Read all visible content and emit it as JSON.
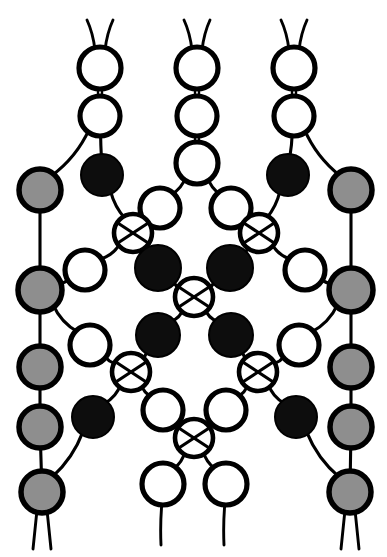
{
  "figure": {
    "width": 387,
    "height": 557,
    "background_color": "#ffffff",
    "stroke_color": "#000000",
    "node_types": {
      "white": {
        "fill": "#ffffff",
        "label": "open node"
      },
      "black": {
        "fill": "#0d0d0d",
        "label": "filled node"
      },
      "gray": {
        "fill": "#8e8e8e",
        "label": "shaded node"
      },
      "crossing": {
        "fill": "#ffffff",
        "label": "crossing node"
      }
    }
  },
  "chart_data": {
    "type": "diagram",
    "xlim": [
      0,
      387
    ],
    "ylim": [
      0,
      557
    ],
    "grid": false,
    "legend": null,
    "nodes": [
      {
        "id": "t1",
        "x": 100,
        "y": 68,
        "r": 21,
        "kind": "white"
      },
      {
        "id": "t2",
        "x": 197,
        "y": 68,
        "r": 21,
        "kind": "white"
      },
      {
        "id": "t3",
        "x": 294,
        "y": 68,
        "r": 21,
        "kind": "white"
      },
      {
        "id": "u1",
        "x": 100,
        "y": 116,
        "r": 20,
        "kind": "white"
      },
      {
        "id": "u2",
        "x": 197,
        "y": 116,
        "r": 20,
        "kind": "white"
      },
      {
        "id": "u3",
        "x": 294,
        "y": 116,
        "r": 20,
        "kind": "white"
      },
      {
        "id": "m2",
        "x": 197,
        "y": 163,
        "r": 21,
        "kind": "white"
      },
      {
        "id": "bL1",
        "x": 102,
        "y": 175,
        "r": 21,
        "kind": "black"
      },
      {
        "id": "bR1",
        "x": 288,
        "y": 175,
        "r": 21,
        "kind": "black"
      },
      {
        "id": "gL1",
        "x": 40,
        "y": 190,
        "r": 21,
        "kind": "gray"
      },
      {
        "id": "gR1",
        "x": 351,
        "y": 190,
        "r": 21,
        "kind": "gray"
      },
      {
        "id": "wL2",
        "x": 160,
        "y": 208,
        "r": 20,
        "kind": "white"
      },
      {
        "id": "wR2",
        "x": 231,
        "y": 208,
        "r": 20,
        "kind": "white"
      },
      {
        "id": "xL1",
        "x": 133,
        "y": 233,
        "r": 19,
        "kind": "crossing"
      },
      {
        "id": "xR1",
        "x": 259,
        "y": 233,
        "r": 19,
        "kind": "crossing"
      },
      {
        "id": "wL3",
        "x": 85,
        "y": 270,
        "r": 20,
        "kind": "white"
      },
      {
        "id": "wR3",
        "x": 305,
        "y": 270,
        "r": 20,
        "kind": "white"
      },
      {
        "id": "bL2",
        "x": 158,
        "y": 268,
        "r": 23,
        "kind": "black"
      },
      {
        "id": "bR2",
        "x": 230,
        "y": 268,
        "r": 23,
        "kind": "black"
      },
      {
        "id": "gL2",
        "x": 40,
        "y": 290,
        "r": 22,
        "kind": "gray"
      },
      {
        "id": "gR2",
        "x": 351,
        "y": 290,
        "r": 22,
        "kind": "gray"
      },
      {
        "id": "xC1",
        "x": 194,
        "y": 297,
        "r": 19,
        "kind": "crossing"
      },
      {
        "id": "bL3",
        "x": 158,
        "y": 335,
        "r": 22,
        "kind": "black"
      },
      {
        "id": "bR3",
        "x": 231,
        "y": 335,
        "r": 22,
        "kind": "black"
      },
      {
        "id": "wL4",
        "x": 90,
        "y": 345,
        "r": 20,
        "kind": "white"
      },
      {
        "id": "wR4",
        "x": 299,
        "y": 345,
        "r": 20,
        "kind": "white"
      },
      {
        "id": "gL3",
        "x": 40,
        "y": 367,
        "r": 21,
        "kind": "gray"
      },
      {
        "id": "gR3",
        "x": 351,
        "y": 367,
        "r": 21,
        "kind": "gray"
      },
      {
        "id": "xL2",
        "x": 131,
        "y": 372,
        "r": 19,
        "kind": "crossing"
      },
      {
        "id": "xR2",
        "x": 258,
        "y": 372,
        "r": 19,
        "kind": "crossing"
      },
      {
        "id": "wL5",
        "x": 163,
        "y": 410,
        "r": 20,
        "kind": "white"
      },
      {
        "id": "wR5",
        "x": 226,
        "y": 410,
        "r": 20,
        "kind": "white"
      },
      {
        "id": "bL4",
        "x": 93,
        "y": 417,
        "r": 21,
        "kind": "black"
      },
      {
        "id": "bR4",
        "x": 296,
        "y": 417,
        "r": 21,
        "kind": "black"
      },
      {
        "id": "gL4",
        "x": 40,
        "y": 427,
        "r": 21,
        "kind": "gray"
      },
      {
        "id": "gR4",
        "x": 351,
        "y": 427,
        "r": 21,
        "kind": "gray"
      },
      {
        "id": "xC2",
        "x": 194,
        "y": 438,
        "r": 19,
        "kind": "crossing"
      },
      {
        "id": "wB1",
        "x": 163,
        "y": 484,
        "r": 21,
        "kind": "white"
      },
      {
        "id": "wB2",
        "x": 226,
        "y": 484,
        "r": 21,
        "kind": "white"
      },
      {
        "id": "gL5",
        "x": 42,
        "y": 492,
        "r": 21,
        "kind": "gray"
      },
      {
        "id": "gR5",
        "x": 350,
        "y": 492,
        "r": 21,
        "kind": "gray"
      }
    ],
    "edges": [
      {
        "from": "t1",
        "to": "u1",
        "style": "double"
      },
      {
        "from": "t2",
        "to": "u2",
        "style": "double"
      },
      {
        "from": "t3",
        "to": "u3",
        "style": "double"
      },
      {
        "from": "u2",
        "to": "m2",
        "style": "double"
      },
      {
        "from": "u1",
        "to": "gL1",
        "style": "curve"
      },
      {
        "from": "u1",
        "to": "bL1",
        "style": "curve"
      },
      {
        "from": "u3",
        "to": "bR1",
        "style": "curve"
      },
      {
        "from": "u3",
        "to": "gR1",
        "style": "curve"
      },
      {
        "from": "m2",
        "to": "wL2",
        "style": "curve"
      },
      {
        "from": "m2",
        "to": "wR2",
        "style": "curve"
      },
      {
        "from": "bL1",
        "to": "xL1",
        "style": "curve"
      },
      {
        "from": "bR1",
        "to": "xR1",
        "style": "curve"
      },
      {
        "from": "wL2",
        "to": "xL1",
        "style": "curve"
      },
      {
        "from": "wR2",
        "to": "xR1",
        "style": "curve"
      },
      {
        "from": "gL1",
        "to": "gL2",
        "style": "line"
      },
      {
        "from": "gR1",
        "to": "gR2",
        "style": "line"
      },
      {
        "from": "xL1",
        "to": "wL3",
        "style": "curve"
      },
      {
        "from": "xR1",
        "to": "wR3",
        "style": "curve"
      },
      {
        "from": "xL1",
        "to": "bL2",
        "style": "curve"
      },
      {
        "from": "xR1",
        "to": "bR2",
        "style": "curve"
      },
      {
        "from": "wL3",
        "to": "gL2",
        "style": "curve"
      },
      {
        "from": "wR3",
        "to": "gR2",
        "style": "curve"
      },
      {
        "from": "bL2",
        "to": "xC1",
        "style": "curve"
      },
      {
        "from": "bR2",
        "to": "xC1",
        "style": "curve"
      },
      {
        "from": "xC1",
        "to": "bL3",
        "style": "curve"
      },
      {
        "from": "xC1",
        "to": "bR3",
        "style": "curve"
      },
      {
        "from": "gL2",
        "to": "wL4",
        "style": "curve"
      },
      {
        "from": "gR2",
        "to": "wR4",
        "style": "curve"
      },
      {
        "from": "gL2",
        "to": "gL3",
        "style": "line"
      },
      {
        "from": "gR2",
        "to": "gR3",
        "style": "line"
      },
      {
        "from": "wL4",
        "to": "xL2",
        "style": "curve"
      },
      {
        "from": "wR4",
        "to": "xR2",
        "style": "curve"
      },
      {
        "from": "bL3",
        "to": "xL2",
        "style": "curve"
      },
      {
        "from": "bR3",
        "to": "xR2",
        "style": "curve"
      },
      {
        "from": "xL2",
        "to": "bL4",
        "style": "curve"
      },
      {
        "from": "xR2",
        "to": "bR4",
        "style": "curve"
      },
      {
        "from": "xL2",
        "to": "wL5",
        "style": "curve"
      },
      {
        "from": "xR2",
        "to": "wR5",
        "style": "curve"
      },
      {
        "from": "wL5",
        "to": "xC2",
        "style": "curve"
      },
      {
        "from": "wR5",
        "to": "xC2",
        "style": "curve"
      },
      {
        "from": "xC2",
        "to": "wB1",
        "style": "curve"
      },
      {
        "from": "xC2",
        "to": "wB2",
        "style": "curve"
      },
      {
        "from": "gL3",
        "to": "gL4",
        "style": "line"
      },
      {
        "from": "gR3",
        "to": "gR4",
        "style": "line"
      },
      {
        "from": "bL4",
        "to": "gL5",
        "style": "curve"
      },
      {
        "from": "bR4",
        "to": "gR5",
        "style": "curve"
      },
      {
        "from": "gL4",
        "to": "gL5",
        "style": "line"
      },
      {
        "from": "gR4",
        "to": "gR5",
        "style": "line"
      }
    ],
    "terminals": {
      "top_antennae": [
        {
          "node": "t1",
          "count": 2
        },
        {
          "node": "t2",
          "count": 2
        },
        {
          "node": "t3",
          "count": 2
        }
      ],
      "bottom_legs": [
        {
          "node": "gL5",
          "count": 2
        },
        {
          "node": "gR5",
          "count": 2
        },
        {
          "node": "wB1",
          "count": 1
        },
        {
          "node": "wB2",
          "count": 1
        }
      ]
    },
    "counts": {
      "white_nodes": 18,
      "black_nodes": 8,
      "gray_nodes": 10,
      "crossing_nodes": 6,
      "total_nodes": 42
    }
  }
}
